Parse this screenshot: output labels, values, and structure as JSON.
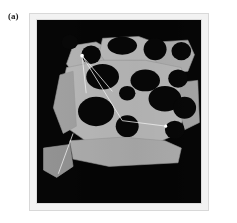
{
  "figure": {
    "panel_label": "(a)",
    "caption": "",
    "type": "grayscale-occupancy-map"
  },
  "colors": {
    "page_background": "#ffffff",
    "frame_outer": "#f2f2f2",
    "frame_inner": "#dcdcdc",
    "map_background": "#050505",
    "free_space_light": "#b9b9b9",
    "free_space_mid": "#a2a2a2",
    "free_space_dark": "#8d8d8d",
    "obstacle": "#070707",
    "edge_line": "#f0f0f0",
    "node_marker": "#ffffff"
  },
  "chart_data": {
    "type": "heatmap",
    "title": "(a)",
    "xlabel": "",
    "ylabel": "",
    "xlim": [
      0,
      100
    ],
    "ylim": [
      0,
      100
    ],
    "grid": false,
    "legend": "none",
    "free_space_regions": [
      {
        "id": "region-upper-left",
        "shade": "#b0b0b0",
        "points": "22,14 36,12 44,16 46,24 40,30 24,31 18,24"
      },
      {
        "id": "region-upper-mid",
        "shade": "#b6b6b6",
        "points": "40,10 62,9 74,13 74,24 60,28 44,26 38,18"
      },
      {
        "id": "region-upper-right",
        "shade": "#ababab",
        "points": "74,12 92,11 96,19 92,28 78,29 72,22"
      },
      {
        "id": "region-center-main",
        "shade": "#b4b4b4",
        "points": "18,26 40,22 66,22 88,26 92,46 86,62 66,70 36,70 20,60 14,42"
      },
      {
        "id": "region-left-column",
        "shade": "#9d9d9d",
        "points": "14,30 22,28 24,58 16,62 10,48"
      },
      {
        "id": "region-lower-strip",
        "shade": "#a8a8a8",
        "points": "20,66 52,64 78,66 88,70 86,78 44,80 22,76"
      },
      {
        "id": "region-lower-left-tail",
        "shade": "#8e8e8e",
        "points": "4,70 20,68 22,80 12,86 4,82"
      },
      {
        "id": "region-right-edge",
        "shade": "#a0a0a0",
        "points": "88,34 98,33 99,56 90,60 86,46"
      }
    ],
    "obstacles": [
      {
        "id": "obstacle-1",
        "cx": 33,
        "cy": 19,
        "rx": 6,
        "ry": 5
      },
      {
        "id": "obstacle-2",
        "cx": 52,
        "cy": 14,
        "rx": 9,
        "ry": 5
      },
      {
        "id": "obstacle-3",
        "cx": 72,
        "cy": 16,
        "rx": 7,
        "ry": 6
      },
      {
        "id": "obstacle-4",
        "cx": 88,
        "cy": 17,
        "rx": 6,
        "ry": 5
      },
      {
        "id": "obstacle-5",
        "cx": 40,
        "cy": 31,
        "rx": 10,
        "ry": 7
      },
      {
        "id": "obstacle-6",
        "cx": 66,
        "cy": 33,
        "rx": 9,
        "ry": 6
      },
      {
        "id": "obstacle-7",
        "cx": 86,
        "cy": 32,
        "rx": 6,
        "ry": 5
      },
      {
        "id": "obstacle-8",
        "cx": 55,
        "cy": 40,
        "rx": 5,
        "ry": 4
      },
      {
        "id": "obstacle-9",
        "cx": 78,
        "cy": 43,
        "rx": 10,
        "ry": 7
      },
      {
        "id": "obstacle-10",
        "cx": 90,
        "cy": 48,
        "rx": 7,
        "ry": 6
      },
      {
        "id": "obstacle-11",
        "cx": 36,
        "cy": 50,
        "rx": 11,
        "ry": 8
      },
      {
        "id": "obstacle-12",
        "cx": 55,
        "cy": 58,
        "rx": 7,
        "ry": 6
      },
      {
        "id": "obstacle-13",
        "cx": 84,
        "cy": 60,
        "rx": 6,
        "ry": 5
      },
      {
        "id": "obstacle-14",
        "cx": 20,
        "cy": 12,
        "rx": 5,
        "ry": 4
      }
    ],
    "graph": {
      "root_node": {
        "id": "node-root",
        "x": 27.5,
        "y": 19.5,
        "label": ""
      },
      "markers": [
        {
          "id": "marker-goal",
          "x": 78.5,
          "y": 58.0,
          "label": ""
        }
      ],
      "edges": [
        {
          "id": "edge-1",
          "from": [
            27.5,
            19.5
          ],
          "to": [
            46.0,
            39.0
          ]
        },
        {
          "id": "edge-2",
          "from": [
            27.5,
            19.5
          ],
          "to": [
            52.0,
            55.0
          ]
        },
        {
          "id": "edge-3",
          "from": [
            52.0,
            55.0
          ],
          "to": [
            78.5,
            58.0
          ]
        },
        {
          "id": "edge-4",
          "from": [
            27.5,
            19.5
          ],
          "to": [
            30.0,
            40.0
          ]
        },
        {
          "id": "edge-5",
          "from": [
            22.0,
            62.0
          ],
          "to": [
            13.0,
            84.0
          ]
        }
      ]
    }
  }
}
